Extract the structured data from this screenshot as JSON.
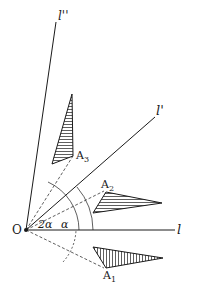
{
  "diagram": {
    "type": "geometric rotation diagram",
    "origin_label": "O",
    "lines": [
      {
        "id": "l",
        "label": "l",
        "angle": "0"
      },
      {
        "id": "l_prime",
        "label": "l'",
        "angle": "α"
      },
      {
        "id": "l_double_prime",
        "label": "l''",
        "angle": "2α"
      }
    ],
    "triangles": [
      {
        "id": "A1",
        "label": "A",
        "subscript": "1"
      },
      {
        "id": "A2",
        "label": "A",
        "subscript": "2"
      },
      {
        "id": "A3",
        "label": "A",
        "subscript": "3"
      }
    ],
    "angle_labels": {
      "alpha": "α",
      "two_alpha": "2α"
    },
    "colors": {
      "ink": "#1a1a1a",
      "background": "#ffffff"
    }
  }
}
